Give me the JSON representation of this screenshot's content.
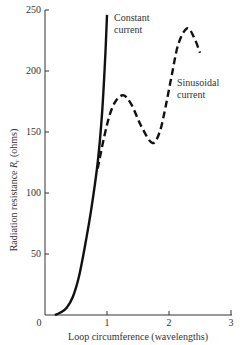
{
  "chart_data": {
    "type": "line",
    "title": "",
    "xlabel": "Loop circumference (wavelengths)",
    "ylabel": "Radiation resistance R_r (ohms)",
    "ylabel_main": "Radiation resistance ",
    "ylabel_symbol": "R",
    "ylabel_sub": "r",
    "ylabel_unit": " (ohms)",
    "xlim": [
      0,
      3
    ],
    "ylim": [
      0,
      250
    ],
    "xticks": [
      0,
      1,
      2,
      3
    ],
    "xtick_labels": [
      "0",
      "1",
      "2",
      "3"
    ],
    "yticks": [
      50,
      100,
      150,
      200,
      250
    ],
    "ytick_labels": [
      "50",
      "100",
      "150",
      "200",
      "250"
    ],
    "grid": false,
    "legend": "none (inline annotations)",
    "series": [
      {
        "name": "Constant current",
        "style": "solid",
        "x": [
          0.16,
          0.25,
          0.35,
          0.45,
          0.55,
          0.65,
          0.75,
          0.85,
          0.92,
          0.97,
          1.0
        ],
        "y": [
          0,
          2,
          6,
          15,
          32,
          58,
          88,
          125,
          165,
          210,
          246
        ]
      },
      {
        "name": "Sinusoidal current",
        "style": "dashed",
        "x": [
          0.85,
          0.95,
          1.05,
          1.15,
          1.27,
          1.4,
          1.55,
          1.73,
          1.85,
          1.95,
          2.05,
          2.15,
          2.29,
          2.4,
          2.5
        ],
        "y": [
          120,
          145,
          165,
          176,
          180,
          172,
          155,
          141,
          150,
          172,
          198,
          222,
          235,
          228,
          215
        ]
      }
    ],
    "annotations": [
      {
        "text_line1": "Constant",
        "text_line2": "current"
      },
      {
        "text_line1": "Sinusoidal",
        "text_line2": "current"
      }
    ]
  }
}
